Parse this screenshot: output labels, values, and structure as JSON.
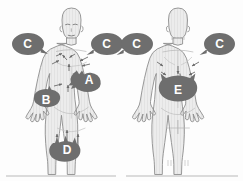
{
  "figure": {
    "panels": [
      {
        "id": "anterior",
        "label": "Anterior view"
      },
      {
        "id": "posterior",
        "label": "Posterior view"
      }
    ]
  },
  "colors": {
    "badge_fill": "#6e6e6e",
    "badge_text": "#ffffff",
    "body_fill": "#ececec",
    "body_stroke": "#8d8d8d",
    "shading": "#dcdcdc",
    "arrow": "#6b6b6b",
    "rule": "#b9b9b9",
    "background": "#fdfdfd"
  },
  "markers": [
    {
      "key": "c-left-front",
      "label": "C",
      "shape": "bubble",
      "tail": "right",
      "view": "anterior",
      "cx": 27,
      "cy": 44
    },
    {
      "key": "c-right-front",
      "label": "C",
      "shape": "bubble",
      "tail": "left",
      "view": "anterior",
      "cx": 106,
      "cy": 44
    },
    {
      "key": "c-left-back",
      "label": "C",
      "shape": "bubble",
      "tail": "left",
      "view": "posterior",
      "cx": 136,
      "cy": 44
    },
    {
      "key": "c-right-back",
      "label": "C",
      "shape": "bubble",
      "tail": "left",
      "view": "posterior",
      "cx": 219,
      "cy": 44
    },
    {
      "key": "a-chest",
      "label": "A",
      "shape": "blob",
      "tail": "none",
      "view": "anterior",
      "cx": 89,
      "cy": 79
    },
    {
      "key": "b-flank",
      "label": "B",
      "shape": "blob",
      "tail": "none",
      "view": "anterior",
      "cx": 46,
      "cy": 100
    },
    {
      "key": "d-pelvis",
      "label": "D",
      "shape": "blob",
      "tail": "none",
      "view": "anterior",
      "cx": 67,
      "cy": 150
    },
    {
      "key": "e-lumbar",
      "label": "E",
      "shape": "blob",
      "tail": "none",
      "view": "posterior",
      "cx": 178,
      "cy": 89
    }
  ],
  "legend_keys": [
    "A",
    "B",
    "C",
    "D",
    "E"
  ],
  "caption_rules": [
    {
      "key": "rule-left",
      "x1": 6,
      "x2": 116,
      "y": 176
    },
    {
      "key": "rule-right",
      "x1": 126,
      "x2": 238,
      "y": 176
    }
  ]
}
